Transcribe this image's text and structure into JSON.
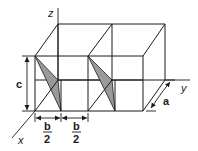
{
  "figure": {
    "axes": {
      "x_label": "x",
      "y_label": "y",
      "z_label": "z"
    },
    "dimensions": {
      "height_label": "c",
      "depth_label": "a",
      "half_width_numerator": "b",
      "half_width_denominator": "2",
      "half_width_segments": [
        {
          "numerator": "b",
          "denominator": "2"
        },
        {
          "numerator": "b",
          "denominator": "2"
        }
      ]
    },
    "shaded_planes_count": 2,
    "colors": {
      "line": "#1a1a1a",
      "shading": "#9a9a9a",
      "background": "#ffffff"
    }
  }
}
